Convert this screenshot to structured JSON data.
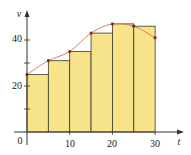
{
  "chart_data": {
    "type": "bar",
    "title": "",
    "xlabel": "t",
    "ylabel": "v",
    "x_ticks": [
      0,
      10,
      20,
      30
    ],
    "x_tick_labels": [
      "0",
      "10",
      "20",
      "30"
    ],
    "y_ticks": [
      10,
      20,
      30,
      40
    ],
    "y_tick_labels": [
      "",
      "20",
      "",
      "40"
    ],
    "xlim": [
      0,
      35
    ],
    "ylim": [
      0,
      52
    ],
    "grid": false,
    "legend": null,
    "bars": {
      "left_edges": [
        0,
        5,
        10,
        15,
        20,
        25
      ],
      "width": 5,
      "heights": [
        25,
        31,
        35,
        43,
        47,
        46
      ],
      "fill_color": "#f7e38a",
      "edge_color": "#3a3a2a"
    },
    "curve": {
      "x": [
        0,
        5,
        10,
        15,
        20,
        25,
        30
      ],
      "y": [
        25,
        31,
        35,
        43,
        47,
        46,
        41
      ],
      "color": "#e0776a",
      "point_color": "#8a2a1a"
    }
  },
  "labels": {
    "x_axis": "t",
    "y_axis": "v",
    "origin": "0",
    "x10": "10",
    "x20": "20",
    "x30": "30",
    "y20": "20",
    "y40": "40"
  },
  "colors": {
    "bar_fill": "#f7e38a",
    "bar_edge": "#3a3a2a",
    "curve": "#e0776a",
    "points": "#8a2a1a",
    "axis": "#333333"
  }
}
